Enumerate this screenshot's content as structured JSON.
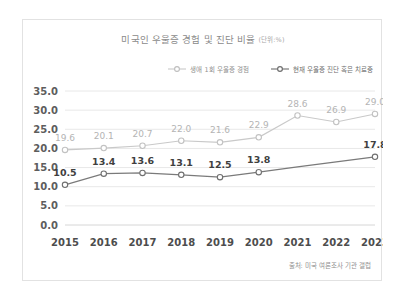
{
  "card": {
    "title_main": "미국인 우울증 경험 및 진단 비율",
    "title_unit": "(단위:%)",
    "source_note": "출처: 미국 여론조사 기관 갤럽"
  },
  "legend": {
    "items": [
      {
        "label": "생애 1회 우울증 경험",
        "color": "#c2c2c2",
        "marker": "open-circle-icon"
      },
      {
        "label": "현재 우울증 진단 혹은 치료중",
        "color": "#6f6f6f",
        "marker": "open-circle-icon"
      }
    ]
  },
  "chart_data": {
    "type": "line",
    "title": "미국인 우울증 경험 및 진단 비율 (단위:%)",
    "xlabel": "",
    "ylabel": "",
    "unit": "%",
    "grid": true,
    "legend_position": "top-right",
    "categories": [
      "2015",
      "2016",
      "2017",
      "2018",
      "2019",
      "2020",
      "2021",
      "2022",
      "2023"
    ],
    "ylim": [
      0.0,
      35.0
    ],
    "yticks": [
      "0.0",
      "5.0",
      "10.0",
      "15.0",
      "20.0",
      "25.0",
      "30.0",
      "35.0"
    ],
    "ytick_values": [
      0.0,
      5.0,
      10.0,
      15.0,
      20.0,
      25.0,
      30.0,
      35.0
    ],
    "series": [
      {
        "name": "생애 1회 우울증 경험",
        "color": "#c2c2c2",
        "values": [
          19.6,
          20.1,
          20.7,
          22.0,
          21.6,
          22.9,
          28.6,
          26.9,
          29.0
        ],
        "labels": [
          "19.6",
          "20.1",
          "20.7",
          "22.0",
          "21.6",
          "22.9",
          "28.6",
          "26.9",
          "29.0"
        ],
        "show_labels": [
          true,
          true,
          true,
          true,
          true,
          true,
          true,
          true,
          true
        ],
        "show_markers": [
          true,
          true,
          true,
          true,
          true,
          true,
          true,
          true,
          true
        ]
      },
      {
        "name": "현재 우울증 진단 혹은 치료중",
        "color": "#6f6f6f",
        "values": [
          10.5,
          13.4,
          13.6,
          13.1,
          12.5,
          13.8,
          15.2,
          16.5,
          17.8
        ],
        "labels": [
          "10.5",
          "13.4",
          "13.6",
          "13.1",
          "12.5",
          "13.8",
          "",
          "",
          "17.8"
        ],
        "show_labels": [
          true,
          true,
          true,
          true,
          true,
          true,
          false,
          false,
          true
        ],
        "show_markers": [
          true,
          true,
          true,
          true,
          true,
          true,
          false,
          false,
          true
        ]
      }
    ],
    "source": "출처: 미국 여론조사 기관 갤럽"
  }
}
